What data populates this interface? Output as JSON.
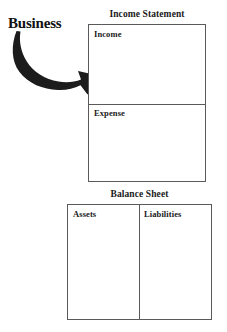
{
  "diagram": {
    "source_label": "Business",
    "arrow_icon": "curved-arrow-icon",
    "statements": [
      {
        "title": "Income Statement",
        "cells": [
          {
            "label": "Income"
          },
          {
            "label": "Expense"
          }
        ]
      },
      {
        "title": "Balance Sheet",
        "cells": [
          {
            "label": "Assets"
          },
          {
            "label": "Liabilities"
          }
        ]
      }
    ]
  },
  "colors": {
    "ink": "#111111",
    "border": "#5a5a5a",
    "arrow": "#1c1c1c",
    "background": "#ffffff"
  }
}
